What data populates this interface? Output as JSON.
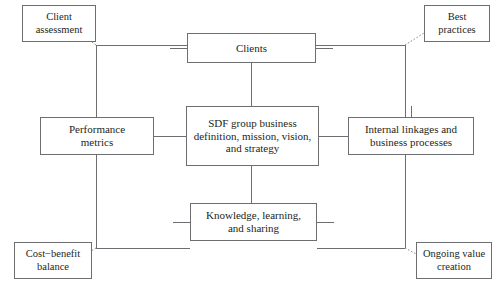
{
  "diagram": {
    "type": "framework-diagram",
    "colors": {
      "box_border": "#6d6e71",
      "connector_line": "#6d6e71",
      "dotted_connector": "#8a8c8e",
      "text": "#231f20",
      "background": "#ffffff"
    },
    "hub": {
      "name": "sdf-group-business",
      "label": "SDF group business\ndefinition, mission, vision,\nand strategy"
    },
    "satellites": [
      {
        "name": "clients",
        "label": "Clients",
        "position": "top"
      },
      {
        "name": "performance-metrics",
        "label": "Performance\nmetrics",
        "position": "left"
      },
      {
        "name": "internal-linkages",
        "label": "Internal linkages and\nbusiness processes",
        "position": "right"
      },
      {
        "name": "knowledge-learning",
        "label": "Knowledge, learning,\nand sharing",
        "position": "bottom"
      }
    ],
    "corners": [
      {
        "name": "client-assessment",
        "label": "Client\nassessment",
        "position": "top-left"
      },
      {
        "name": "best-practices",
        "label": "Best\npractices",
        "position": "top-right"
      },
      {
        "name": "cost-benefit",
        "label": "Cost−benefit\nbalance",
        "position": "bottom-left"
      },
      {
        "name": "ongoing-value",
        "label": "Ongoing value\ncreation",
        "position": "bottom-right"
      }
    ],
    "connectors": {
      "frame": {
        "left_x": 96,
        "right_x": 405,
        "top_y": 45,
        "bottom_y": 248,
        "style": "solid"
      },
      "corner_links": {
        "style": "dotted"
      },
      "hub_links": {
        "style": "solid",
        "targets": [
          "clients",
          "performance-metrics",
          "internal-linkages",
          "knowledge-learning"
        ]
      }
    }
  }
}
